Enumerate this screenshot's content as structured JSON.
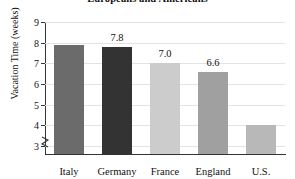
{
  "chart_data": {
    "type": "bar",
    "title": "Europeans and Americans",
    "title_lines": [
      "Europeans and Americans"
    ],
    "xlabel": "",
    "ylabel": "Vacation Time (weeks)",
    "categories": [
      "Italy",
      "Germany",
      "France",
      "England",
      "U.S."
    ],
    "values": [
      7.9,
      7.8,
      7.0,
      6.6,
      4.0
    ],
    "data_labels": [
      "",
      "7.8",
      "7.0",
      "6.6",
      ""
    ],
    "bar_colors": [
      "#6b6b6b",
      "#333333",
      "#cccccc",
      "#a0a0a0",
      "#b8b8b8"
    ],
    "ylim": [
      2.6,
      9.0
    ],
    "yticks": [
      3,
      4,
      5,
      6,
      7,
      8,
      9
    ],
    "ytick_labels": [
      "3",
      "4",
      "5",
      "6",
      "7",
      "8",
      "9"
    ],
    "grid": true,
    "axis_break": true,
    "legend": "none"
  }
}
